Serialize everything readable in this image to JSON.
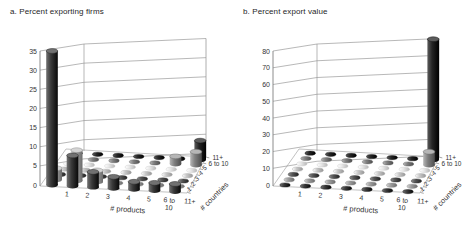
{
  "figure": {
    "background": "#ffffff"
  },
  "chart_data": [
    {
      "type": "bar",
      "subtype": "3d-cylinder",
      "title": "a. Percent exporting firms",
      "xlabel": "# products",
      "depth_label": "# countries",
      "ylabel": "",
      "x_categories": [
        "1",
        "2",
        "3",
        "4",
        "5",
        "6 to 10",
        "11+"
      ],
      "depth_categories": [
        "1",
        "2",
        "3",
        "4",
        "5",
        "6 to 10",
        "11+"
      ],
      "ylim": [
        0,
        35
      ],
      "yticks": [
        0,
        5,
        10,
        15,
        20,
        25,
        30,
        35
      ],
      "grid": true,
      "legend": "none",
      "series": [
        {
          "name": "1",
          "color": "#3a3a3a",
          "values": [
            35,
            8,
            4,
            3,
            2,
            2,
            2
          ]
        },
        {
          "name": "2",
          "color": "#9e9e9e",
          "values": [
            3,
            8,
            3,
            0,
            0,
            0,
            0
          ]
        },
        {
          "name": "3",
          "color": "#555555",
          "values": [
            0,
            0,
            0,
            0,
            0,
            0,
            0
          ]
        },
        {
          "name": "4",
          "color": "#c8c8c8",
          "values": [
            0,
            0,
            0,
            0,
            0,
            0,
            0
          ]
        },
        {
          "name": "5",
          "color": "#e8e8e8",
          "values": [
            0,
            0,
            0,
            0,
            0,
            0,
            0
          ]
        },
        {
          "name": "6 to 10",
          "color": "#7f7f7f",
          "values": [
            0,
            0,
            0,
            0,
            0,
            2,
            3.5
          ]
        },
        {
          "name": "11+",
          "color": "#252525",
          "values": [
            0,
            0,
            0,
            0,
            0,
            0,
            5
          ]
        }
      ]
    },
    {
      "type": "bar",
      "subtype": "3d-cylinder",
      "title": "b. Percent export value",
      "xlabel": "# products",
      "depth_label": "# countries",
      "ylabel": "",
      "x_categories": [
        "1",
        "2",
        "3",
        "4",
        "5",
        "6 to 10",
        "11+"
      ],
      "depth_categories": [
        "1",
        "2",
        "3",
        "4",
        "5",
        "6 to 10",
        "11+"
      ],
      "ylim": [
        0,
        80
      ],
      "yticks": [
        0,
        10,
        20,
        30,
        40,
        50,
        60,
        70,
        80
      ],
      "grid": true,
      "legend": "none",
      "series": [
        {
          "name": "1",
          "color": "#3a3a3a",
          "values": [
            0,
            0,
            0,
            0,
            0,
            0,
            0
          ]
        },
        {
          "name": "2",
          "color": "#9e9e9e",
          "values": [
            0,
            0,
            0,
            0,
            0,
            0,
            0
          ]
        },
        {
          "name": "3",
          "color": "#555555",
          "values": [
            0,
            0,
            0,
            0,
            0,
            0,
            0
          ]
        },
        {
          "name": "4",
          "color": "#c8c8c8",
          "values": [
            0,
            0,
            0,
            0,
            0,
            0,
            0
          ]
        },
        {
          "name": "5",
          "color": "#e8e8e8",
          "values": [
            0,
            0,
            0,
            0,
            0,
            0,
            0
          ]
        },
        {
          "name": "6 to 10",
          "color": "#7f7f7f",
          "values": [
            0,
            0,
            0,
            0,
            0,
            0,
            8
          ]
        },
        {
          "name": "11+",
          "color": "#252525",
          "values": [
            0,
            0,
            0,
            0,
            0,
            0,
            72
          ]
        }
      ]
    }
  ]
}
